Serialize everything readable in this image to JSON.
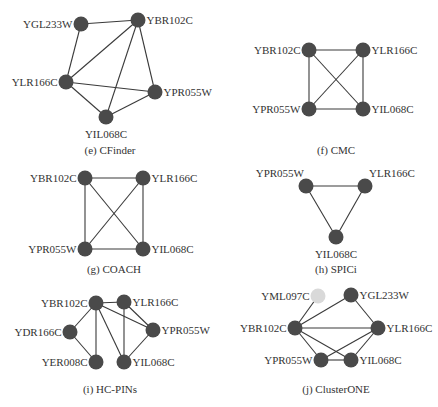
{
  "figure": {
    "panels": [
      {
        "id": "e",
        "caption": "(e) CFinder",
        "caption_pos": [
          110,
          154
        ],
        "nodes": [
          {
            "name": "YGL233W",
            "x": 81,
            "y": 24,
            "label_side": "left"
          },
          {
            "name": "YBR102C",
            "x": 138,
            "y": 20,
            "label_side": "right"
          },
          {
            "name": "YLR166C",
            "x": 66,
            "y": 82,
            "label_side": "left"
          },
          {
            "name": "YPR055W",
            "x": 155,
            "y": 92,
            "label_side": "right"
          },
          {
            "name": "YIL068C",
            "x": 106,
            "y": 117,
            "label_side": "below"
          }
        ],
        "edges": [
          [
            "YGL233W",
            "YBR102C"
          ],
          [
            "YGL233W",
            "YLR166C"
          ],
          [
            "YBR102C",
            "YLR166C"
          ],
          [
            "YBR102C",
            "YPR055W"
          ],
          [
            "YBR102C",
            "YIL068C"
          ],
          [
            "YLR166C",
            "YPR055W"
          ],
          [
            "YLR166C",
            "YIL068C"
          ],
          [
            "YPR055W",
            "YIL068C"
          ]
        ]
      },
      {
        "id": "f",
        "caption": "(f) CMC",
        "caption_pos": [
          336,
          154
        ],
        "nodes": [
          {
            "name": "YBR102C",
            "x": 309,
            "y": 50,
            "label_side": "left"
          },
          {
            "name": "YLR166C",
            "x": 363,
            "y": 50,
            "label_side": "right"
          },
          {
            "name": "YPR055W",
            "x": 309,
            "y": 109,
            "label_side": "left"
          },
          {
            "name": "YIL068C",
            "x": 363,
            "y": 109,
            "label_side": "right"
          }
        ],
        "edges": [
          [
            "YBR102C",
            "YLR166C"
          ],
          [
            "YBR102C",
            "YPR055W"
          ],
          [
            "YBR102C",
            "YIL068C"
          ],
          [
            "YLR166C",
            "YPR055W"
          ],
          [
            "YLR166C",
            "YIL068C"
          ],
          [
            "YPR055W",
            "YIL068C"
          ]
        ]
      },
      {
        "id": "g",
        "caption": "(g) COACH",
        "caption_pos": [
          114,
          273
        ],
        "nodes": [
          {
            "name": "YBR102C",
            "x": 85,
            "y": 178,
            "label_side": "left"
          },
          {
            "name": "YLR166C",
            "x": 143,
            "y": 178,
            "label_side": "right"
          },
          {
            "name": "YPR055W",
            "x": 85,
            "y": 249,
            "label_side": "left"
          },
          {
            "name": "YIL068C",
            "x": 143,
            "y": 249,
            "label_side": "right"
          }
        ],
        "edges": [
          [
            "YBR102C",
            "YLR166C"
          ],
          [
            "YBR102C",
            "YPR055W"
          ],
          [
            "YBR102C",
            "YIL068C"
          ],
          [
            "YLR166C",
            "YPR055W"
          ],
          [
            "YLR166C",
            "YIL068C"
          ],
          [
            "YPR055W",
            "YIL068C"
          ]
        ]
      },
      {
        "id": "h",
        "caption": "(h) SPICi",
        "caption_pos": [
          336,
          273
        ],
        "nodes": [
          {
            "name": "YPR055W",
            "x": 306,
            "y": 186,
            "label_side": "above-left"
          },
          {
            "name": "YLR166C",
            "x": 365,
            "y": 186,
            "label_side": "above-right"
          },
          {
            "name": "YIL068C",
            "x": 336,
            "y": 237,
            "label_side": "below"
          }
        ],
        "edges": [
          [
            "YPR055W",
            "YLR166C"
          ],
          [
            "YPR055W",
            "YIL068C"
          ],
          [
            "YLR166C",
            "YIL068C"
          ]
        ]
      },
      {
        "id": "i",
        "caption": "(i) HC-PINs",
        "caption_pos": [
          110,
          393
        ],
        "nodes": [
          {
            "name": "YBR102C",
            "x": 96,
            "y": 303,
            "label_side": "left"
          },
          {
            "name": "YLR166C",
            "x": 124,
            "y": 302,
            "label_side": "right"
          },
          {
            "name": "YDR166C",
            "x": 70,
            "y": 332,
            "label_side": "left"
          },
          {
            "name": "YPR055W",
            "x": 153,
            "y": 330,
            "label_side": "right"
          },
          {
            "name": "YER008C",
            "x": 96,
            "y": 362,
            "label_side": "left"
          },
          {
            "name": "YIL068C",
            "x": 124,
            "y": 362,
            "label_side": "right"
          }
        ],
        "edges": [
          [
            "YBR102C",
            "YLR166C"
          ],
          [
            "YBR102C",
            "YDR166C"
          ],
          [
            "YBR102C",
            "YPR055W"
          ],
          [
            "YBR102C",
            "YER008C"
          ],
          [
            "YBR102C",
            "YIL068C"
          ],
          [
            "YDR166C",
            "YER008C"
          ],
          [
            "YLR166C",
            "YPR055W"
          ],
          [
            "YLR166C",
            "YIL068C"
          ],
          [
            "YPR055W",
            "YIL068C"
          ]
        ]
      },
      {
        "id": "j",
        "caption": "(j) ClusterONE",
        "caption_pos": [
          336,
          393
        ],
        "nodes": [
          {
            "name": "YML097C",
            "x": 318,
            "y": 296,
            "label_side": "left",
            "light": true
          },
          {
            "name": "YGL233W",
            "x": 351,
            "y": 295,
            "label_side": "right"
          },
          {
            "name": "YBR102C",
            "x": 295,
            "y": 328,
            "label_side": "left"
          },
          {
            "name": "YLR166C",
            "x": 378,
            "y": 328,
            "label_side": "right"
          },
          {
            "name": "YPR055W",
            "x": 321,
            "y": 360,
            "label_side": "left"
          },
          {
            "name": "YIL068C",
            "x": 351,
            "y": 360,
            "label_side": "right"
          }
        ],
        "edges": [
          [
            "YML097C",
            "YBR102C"
          ],
          [
            "YGL233W",
            "YBR102C"
          ],
          [
            "YGL233W",
            "YLR166C"
          ],
          [
            "YBR102C",
            "YLR166C"
          ],
          [
            "YBR102C",
            "YPR055W"
          ],
          [
            "YBR102C",
            "YIL068C"
          ],
          [
            "YLR166C",
            "YPR055W"
          ],
          [
            "YLR166C",
            "YIL068C"
          ],
          [
            "YPR055W",
            "YIL068C"
          ]
        ]
      }
    ],
    "colors": {
      "node": "#4a4a4a",
      "node_light": "#d9d9d9",
      "edge": "#3a3a3a",
      "text": "#333333"
    }
  }
}
